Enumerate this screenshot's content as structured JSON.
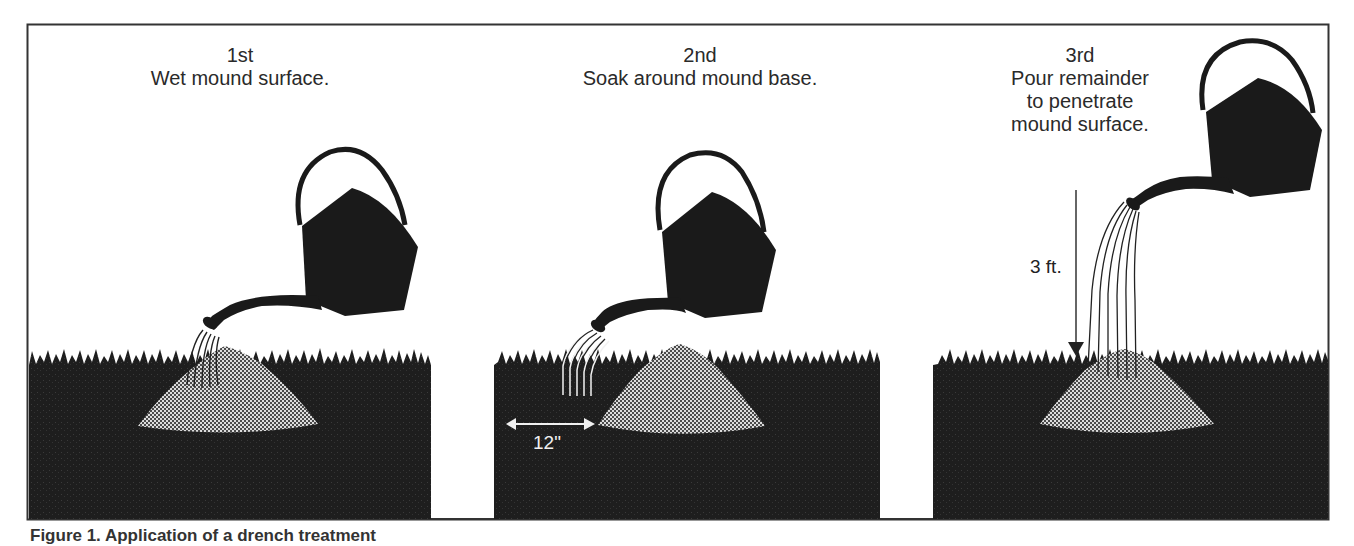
{
  "figure": {
    "panels": [
      {
        "step": "1st",
        "instruction_lines": [
          "Wet mound surface."
        ]
      },
      {
        "step": "2nd",
        "instruction_lines": [
          "Soak around mound base."
        ],
        "distance_label": "12\""
      },
      {
        "step": "3rd",
        "instruction_lines": [
          "Pour remainder",
          "to penetrate",
          "mound surface."
        ],
        "height_label": "3 ft."
      }
    ],
    "caption_partial": "Figure 1. Application of a drench treatment"
  },
  "colors": {
    "ground": "#1c1c1c",
    "can": "#1a1a1a",
    "mound_light": "#d8d8d8",
    "mound_dark": "#555555",
    "border": "#333333",
    "text": "#2a2a2a"
  }
}
